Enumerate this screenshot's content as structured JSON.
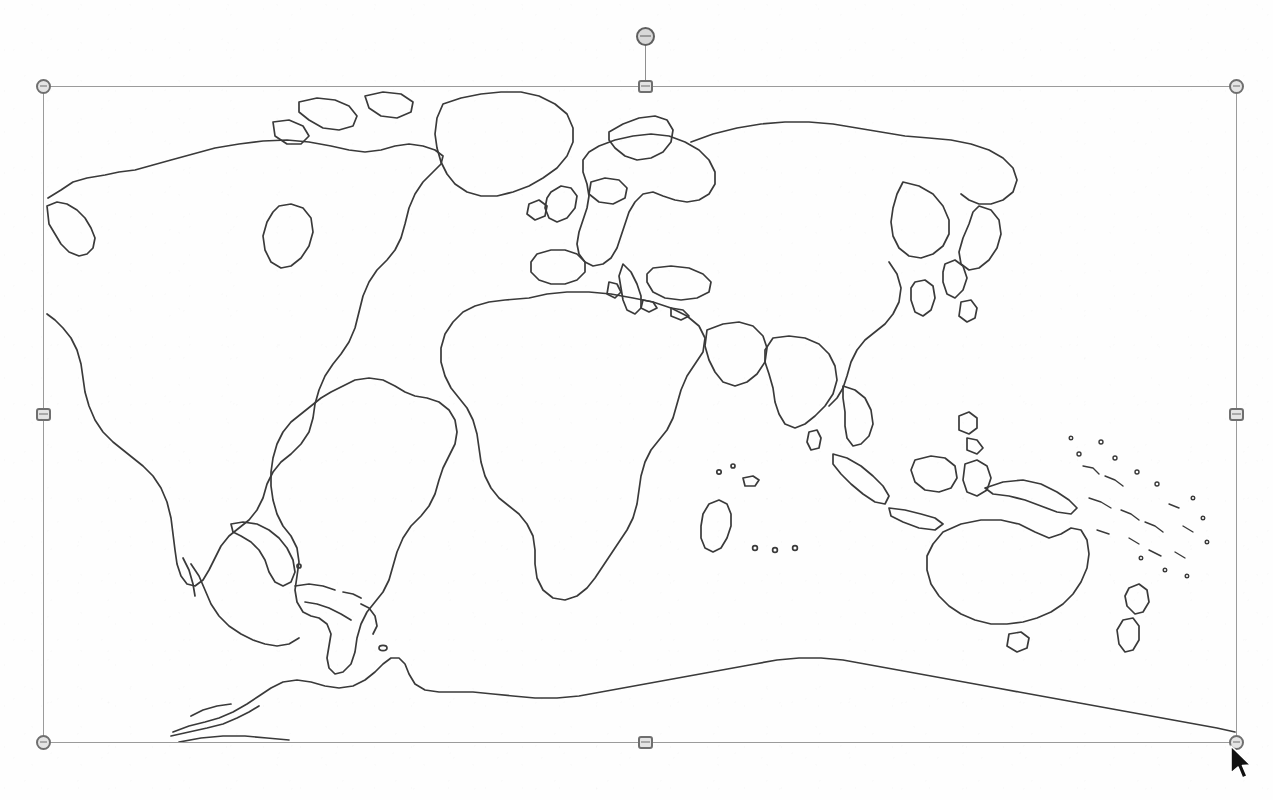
{
  "canvas": {
    "width": 1273,
    "height": 800,
    "background_color": "#fefefe"
  },
  "document": {
    "object_type": "Picture",
    "object_name": "World Outline Map",
    "selection_state": "selected",
    "accent_color": "#9b9b9b",
    "handle_fill_color": "#e4e4e4",
    "handle_border_color": "#6f6f6f"
  },
  "image_object": {
    "name": "world-outline-map",
    "alt_text": "Blank outline map of the world",
    "bounds": {
      "left": 43,
      "top": 86,
      "width": 1193,
      "height": 656
    },
    "stroke_color": "#3a3a3a",
    "fill_color": "none"
  },
  "selection": {
    "rotation_handle": {
      "name": "rotation-handle",
      "x": 645,
      "y": 36,
      "tooltip": "Rotate"
    },
    "rotation_stem": {
      "from_y": 45,
      "to_y": 86
    },
    "handles": [
      {
        "name": "handle-top-left",
        "shape": "circle",
        "x": 43,
        "y": 86,
        "cursor": "nwse-resize"
      },
      {
        "name": "handle-top-center",
        "shape": "square",
        "x": 645,
        "y": 86,
        "cursor": "ns-resize"
      },
      {
        "name": "handle-top-right",
        "shape": "circle",
        "x": 1236,
        "y": 86,
        "cursor": "nesw-resize"
      },
      {
        "name": "handle-middle-left",
        "shape": "square",
        "x": 43,
        "y": 414,
        "cursor": "ew-resize"
      },
      {
        "name": "handle-middle-right",
        "shape": "square",
        "x": 1236,
        "y": 414,
        "cursor": "ew-resize"
      },
      {
        "name": "handle-bottom-left",
        "shape": "circle",
        "x": 43,
        "y": 742,
        "cursor": "nesw-resize"
      },
      {
        "name": "handle-bottom-center",
        "shape": "square",
        "x": 645,
        "y": 742,
        "cursor": "ns-resize"
      },
      {
        "name": "handle-bottom-right",
        "shape": "circle",
        "x": 1236,
        "y": 742,
        "cursor": "nwse-resize"
      }
    ]
  },
  "pointer": {
    "name": "mouse-cursor",
    "type": "arrow",
    "x": 1228,
    "y": 744,
    "over_handle": "handle-bottom-right"
  },
  "map_content": {
    "projection": "equirectangular",
    "style": "line-art outline, scanned photocopy",
    "landmasses": [
      "North America",
      "Greenland",
      "South America",
      "Europe",
      "Africa",
      "Asia",
      "Australia",
      "New Guinea",
      "New Zealand",
      "Antarctica",
      "Japan",
      "Madagascar",
      "Indonesia",
      "Philippines",
      "British Isles",
      "Caribbean Islands",
      "Pacific Islands"
    ]
  }
}
